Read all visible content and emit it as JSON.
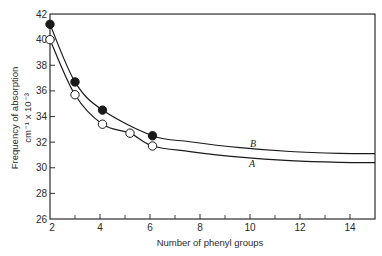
{
  "chart_data": {
    "type": "line",
    "title": "",
    "xlabel": "Number of phenyl groups",
    "ylabel": "Frequency of absorption",
    "ylabel_units": "cm⁻¹ x 10⁻³",
    "xlim": [
      2,
      15
    ],
    "ylim": [
      26,
      42
    ],
    "xticks": [
      2,
      4,
      6,
      8,
      10,
      12,
      14
    ],
    "xminor_ticks": [
      3,
      5,
      7,
      9,
      11,
      13
    ],
    "yticks": [
      26,
      28,
      30,
      32,
      34,
      36,
      38,
      40,
      42
    ],
    "grid": false,
    "legend": "none (curves labeled inline)",
    "series": [
      {
        "name": "B",
        "marker": "filled circle",
        "points": [
          {
            "x": 2.0,
            "y": 41.2
          },
          {
            "x": 3.0,
            "y": 36.7
          },
          {
            "x": 4.1,
            "y": 34.5
          },
          {
            "x": 6.1,
            "y": 32.5
          }
        ],
        "curve_end": {
          "x": 15,
          "y": 31.1
        }
      },
      {
        "name": "A",
        "marker": "open circle",
        "points": [
          {
            "x": 2.0,
            "y": 40.0
          },
          {
            "x": 3.0,
            "y": 35.7
          },
          {
            "x": 4.1,
            "y": 33.4
          },
          {
            "x": 5.2,
            "y": 32.7
          },
          {
            "x": 6.1,
            "y": 31.7
          }
        ],
        "curve_end": {
          "x": 15,
          "y": 30.4
        }
      }
    ],
    "annotations": [
      "B",
      "A"
    ]
  },
  "labels": {
    "xlabel": "Number of phenyl groups",
    "ylabel_line1": "Frequency of absorption",
    "ylabel_line2": "cm⁻¹ x 10⁻³",
    "curve_b": "B",
    "curve_a": "A"
  },
  "colors": {
    "ink": "#1a1a1a",
    "background": "#ffffff"
  }
}
